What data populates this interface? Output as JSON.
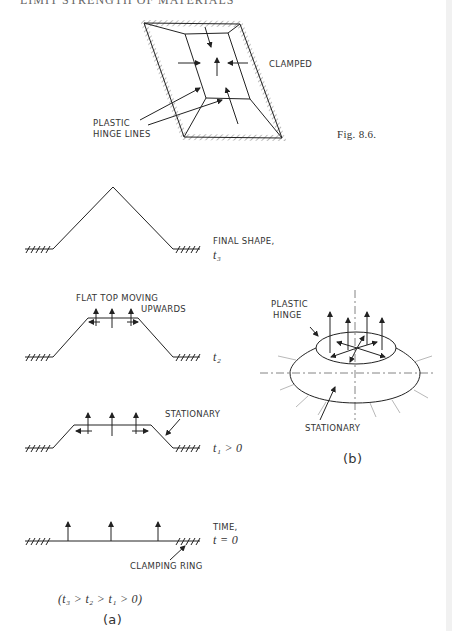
{
  "header": {
    "running_title": "LIMIT STRENGTH OF MATERIALS"
  },
  "figure_8_6": {
    "caption": "Fig. 8.6.",
    "labels": {
      "clamped": "CLAMPED",
      "hinge_line1": "PLASTIC",
      "hinge_line2": "HINGE LINES"
    }
  },
  "figure_a": {
    "stages": [
      {
        "label_line1": "FINAL SHAPE,",
        "time": "t₃"
      },
      {
        "label_line1": "FLAT TOP  MOVING",
        "label_line2": "UPWARDS",
        "time": "t₂"
      },
      {
        "label_line1": "STATIONARY",
        "time": "t₁ > 0"
      },
      {
        "label_line1": "TIME,",
        "time": "t = 0",
        "annotation": "CLAMPING RING"
      }
    ],
    "relation": "(t₃ > t₂ > t₁ > 0)",
    "caption": "(a)"
  },
  "figure_b": {
    "labels": {
      "hinge_line1": "PLASTIC",
      "hinge_line2": "HINGE",
      "stationary": "STATIONARY"
    },
    "caption": "(b)"
  }
}
